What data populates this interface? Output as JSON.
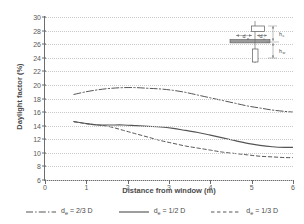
{
  "chart_data": {
    "type": "line",
    "title": "",
    "xlabel": "Distance from window (m)",
    "ylabel": "Daylight factor (%)",
    "xlim": [
      0,
      6
    ],
    "ylim": [
      6,
      30
    ],
    "xticks": [
      0,
      1,
      2,
      3,
      4,
      5,
      6
    ],
    "yticks": [
      6,
      8,
      10,
      12,
      14,
      16,
      18,
      20,
      22,
      24,
      26,
      28,
      30
    ],
    "grid": "horizontal-dotted",
    "legend_position": "bottom",
    "series": [
      {
        "name": "de = 2/3 D",
        "label_main": "d",
        "label_sub": "e",
        "label_rest": " = 2/3 D",
        "style": "dash-dot",
        "color": "#555555",
        "x": [
          0.7,
          1.0,
          1.3,
          1.6,
          1.9,
          2.2,
          2.5,
          2.8,
          3.1,
          3.4,
          3.7,
          4.0,
          4.3,
          4.6,
          4.9,
          5.2,
          5.5,
          5.8,
          6.0
        ],
        "y": [
          18.6,
          19.0,
          19.3,
          19.5,
          19.6,
          19.6,
          19.5,
          19.4,
          19.2,
          18.9,
          18.5,
          18.1,
          17.7,
          17.3,
          16.9,
          16.6,
          16.3,
          16.1,
          16.0
        ]
      },
      {
        "name": "de = 1/2 D",
        "label_main": "d",
        "label_sub": "e",
        "label_rest": " = 1/2 D",
        "style": "solid",
        "color": "#555555",
        "x": [
          0.7,
          1.0,
          1.3,
          1.6,
          1.9,
          2.2,
          2.5,
          2.8,
          3.1,
          3.4,
          3.7,
          4.0,
          4.3,
          4.6,
          4.9,
          5.2,
          5.5,
          5.8,
          6.0
        ],
        "y": [
          14.6,
          14.3,
          14.1,
          14.1,
          14.1,
          14.0,
          13.9,
          13.8,
          13.6,
          13.3,
          13.0,
          12.6,
          12.2,
          11.8,
          11.4,
          11.1,
          10.9,
          10.8,
          10.8
        ]
      },
      {
        "name": "de = 1/3 D",
        "label_main": "d",
        "label_sub": "e",
        "label_rest": " = 1/3 D",
        "style": "dashed",
        "color": "#555555",
        "x": [
          0.7,
          1.0,
          1.3,
          1.6,
          1.9,
          2.2,
          2.5,
          2.8,
          3.1,
          3.4,
          3.7,
          4.0,
          4.3,
          4.6,
          4.9,
          5.2,
          5.5,
          5.8,
          6.0
        ],
        "y": [
          14.6,
          14.3,
          14.1,
          13.8,
          13.3,
          12.8,
          12.3,
          11.8,
          11.4,
          11.0,
          10.7,
          10.4,
          10.1,
          9.9,
          9.7,
          9.5,
          9.4,
          9.3,
          9.3
        ]
      }
    ]
  },
  "inset": {
    "name": "window-section-diagram",
    "labels": {
      "de": "d",
      "de_sub": "e",
      "di": "d",
      "di_sub": "i",
      "hc": "h",
      "hc_sub": "c",
      "hw": "h",
      "hw_sub": "w"
    }
  }
}
